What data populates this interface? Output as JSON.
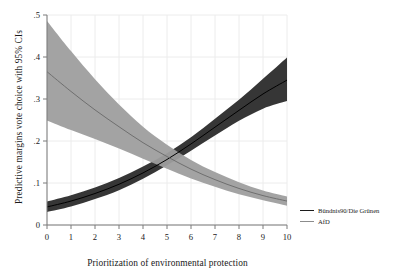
{
  "chart_data": {
    "type": "line",
    "title": "",
    "xlabel": "Prioritization of environmental protection",
    "ylabel": "Predictive margins vote choice with 95% CIs",
    "xlim": [
      0,
      10
    ],
    "ylim": [
      0,
      0.5
    ],
    "xticks": [
      "0",
      "1",
      "2",
      "3",
      "4",
      "5",
      "6",
      "7",
      "8",
      "9",
      "10"
    ],
    "yticks": [
      "0",
      ".1",
      ".2",
      ".3",
      ".4",
      ".5"
    ],
    "grid": true,
    "legend_position": "right",
    "x": [
      0,
      1,
      2,
      3,
      4,
      5,
      6,
      7,
      8,
      9,
      10
    ],
    "series": [
      {
        "name": "Bündnis90/Die Grünen",
        "color": "#1c1c1c",
        "band_color": "#2b2b2b",
        "values": [
          0.043,
          0.057,
          0.075,
          0.097,
          0.124,
          0.156,
          0.193,
          0.233,
          0.273,
          0.312,
          0.345
        ],
        "ci_lower": [
          0.031,
          0.044,
          0.062,
          0.083,
          0.11,
          0.142,
          0.177,
          0.213,
          0.248,
          0.277,
          0.295
        ],
        "ci_upper": [
          0.056,
          0.071,
          0.089,
          0.112,
          0.139,
          0.171,
          0.209,
          0.253,
          0.298,
          0.348,
          0.399
        ]
      },
      {
        "name": "AfD",
        "color": "#8c8c8c",
        "band_color": "#9e9e9e",
        "values": [
          0.365,
          0.318,
          0.274,
          0.234,
          0.196,
          0.163,
          0.133,
          0.108,
          0.087,
          0.07,
          0.057
        ],
        "ci_lower": [
          0.249,
          0.226,
          0.205,
          0.182,
          0.158,
          0.134,
          0.111,
          0.091,
          0.073,
          0.059,
          0.046
        ],
        "ci_upper": [
          0.486,
          0.414,
          0.347,
          0.287,
          0.234,
          0.191,
          0.155,
          0.126,
          0.102,
          0.082,
          0.068
        ]
      }
    ],
    "legend": [
      {
        "label": "Bündnis90/Die Grünen",
        "color": "#1c1c1c"
      },
      {
        "label": "AfD",
        "color": "#8c8c8c"
      }
    ]
  },
  "axes": {
    "y_label_text": "Predictive margins vote choice with 95% CIs",
    "x_label_text": "Prioritization of environmental protection"
  },
  "colors": {
    "grid": "#ececec",
    "axis": "#7a7a7a",
    "green_party": "#1c1c1c",
    "afd": "#8c8c8c",
    "background": "#ffffff"
  }
}
